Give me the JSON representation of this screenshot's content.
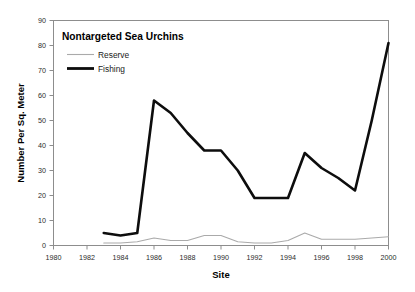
{
  "chart_data": {
    "type": "line",
    "title": "Nontargeted Sea Urchins",
    "xlabel": "Site",
    "ylabel": "Number Per Sq. Meter",
    "xlim": [
      1980,
      2000
    ],
    "ylim": [
      0,
      90
    ],
    "grid": false,
    "legend_position": "top-left-inside",
    "x_ticks": [
      1980,
      1982,
      1984,
      1986,
      1988,
      1990,
      1992,
      1994,
      1996,
      1998,
      2000
    ],
    "x_tick_labels": [
      "1980",
      "1982",
      "1984",
      "1986",
      "1988",
      "1990",
      "1992",
      "1994",
      "1996",
      "1998",
      "2000"
    ],
    "y_ticks": [
      0,
      10,
      20,
      30,
      40,
      50,
      60,
      70,
      80,
      90
    ],
    "y_tick_labels": [
      "0",
      "10",
      "20",
      "30",
      "40",
      "50",
      "60",
      "70",
      "80",
      "90"
    ],
    "x": [
      1983,
      1984,
      1985,
      1986,
      1987,
      1988,
      1989,
      1990,
      1991,
      1992,
      1993,
      1994,
      1995,
      1996,
      1997,
      1998,
      1999,
      2000
    ],
    "series": [
      {
        "name": "Reserve",
        "color": "#aaaaaa",
        "style": "thin-line",
        "values": [
          1,
          1,
          1.5,
          3,
          2,
          2,
          4,
          4,
          1.5,
          1,
          1,
          2,
          5,
          2.5,
          2.5,
          2.5,
          3,
          3.5
        ]
      },
      {
        "name": "Fishing",
        "color": "#0d0d0d",
        "style": "thick-line",
        "values": [
          5,
          4,
          5,
          58,
          53,
          45,
          38,
          38,
          30,
          19,
          19,
          19,
          37,
          31,
          27,
          22,
          50,
          81
        ]
      }
    ]
  },
  "legend": {
    "entries": [
      {
        "label": "Reserve"
      },
      {
        "label": "Fishing"
      }
    ]
  },
  "colors": {
    "fishing_line": "#0d0d0d",
    "reserve_line": "#aaaaaa",
    "axis": "#8d8d8d",
    "background": "#ffffff"
  }
}
